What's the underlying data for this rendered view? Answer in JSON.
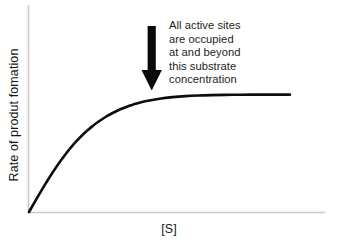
{
  "figure": {
    "background_color": "#ffffff",
    "curve_color": "#0d0d0d",
    "axis_color": "#c9c9c9",
    "text_color": "#1a1a1a",
    "arrow_color": "#0a0a0a"
  },
  "annotation": {
    "lines": [
      "All active sites",
      "are occupied",
      "at and beyond",
      "this substrate",
      "concentration"
    ],
    "full_text": "All active sites are occupied at and beyond this substrate concentration",
    "arrow_icon": "down-arrow-icon"
  },
  "chart_data": {
    "type": "line",
    "title": "",
    "subtitle": "",
    "xlabel": "[S]",
    "ylabel": "Rate of produt fomation",
    "xlim": [
      0,
      100
    ],
    "ylim": [
      0,
      100
    ],
    "grid": false,
    "legend": null,
    "xticks": [],
    "yticks": [],
    "xticklabels": [],
    "yticklabels": [],
    "series": [
      {
        "name": "Rate of product formation vs substrate concentration",
        "description": "Michaelis-Menten saturation curve: rises steeply and linearly at low [S], bends through a knee, then plateaus at Vmax",
        "color": "#0d0d0d",
        "linewidth": 2.6,
        "x": [
          0,
          2,
          4,
          6,
          8,
          10,
          12,
          14,
          16,
          18,
          20,
          22,
          24,
          26,
          28,
          30,
          32,
          34,
          36,
          38,
          40,
          45,
          50,
          55,
          60,
          65,
          70,
          75,
          80,
          85,
          90,
          95,
          100
        ],
        "y": [
          0,
          7.2,
          14.3,
          21.2,
          27.8,
          34.1,
          40.0,
          45.5,
          50.6,
          55.3,
          59.6,
          63.5,
          67.0,
          70.2,
          73.0,
          75.6,
          77.9,
          79.9,
          81.7,
          83.3,
          84.7,
          87.4,
          89.2,
          90.4,
          91.2,
          91.7,
          92.0,
          92.2,
          92.3,
          92.4,
          92.4,
          92.4,
          92.4
        ]
      }
    ],
    "annotations": [
      {
        "text": "All active sites are occupied at and beyond this substrate concentration",
        "arrow": "down",
        "points_to_x": 50,
        "points_to_y": 92
      }
    ]
  }
}
